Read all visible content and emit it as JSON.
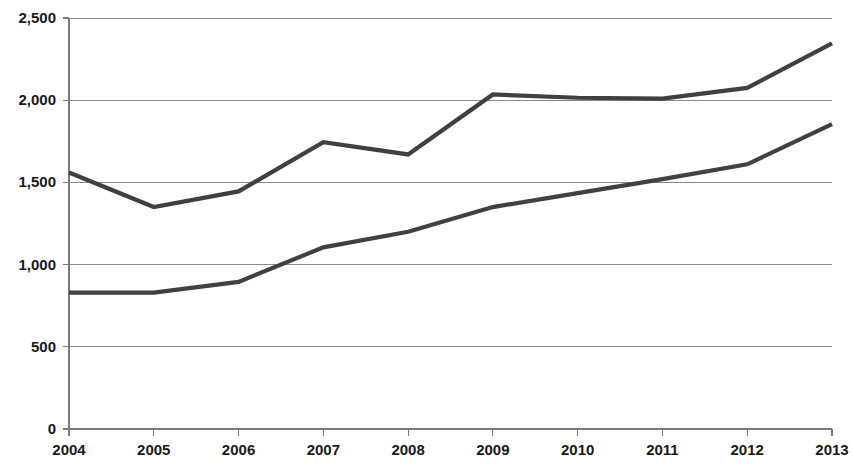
{
  "chart_data": {
    "type": "line",
    "title": "",
    "subtitle": "",
    "xlabel": "",
    "ylabel": "",
    "categories": [
      "2004",
      "2005",
      "2006",
      "2007",
      "2008",
      "2009",
      "2010",
      "2011",
      "2012",
      "2013"
    ],
    "x": [
      2004,
      2005,
      2006,
      2007,
      2008,
      2009,
      2010,
      2011,
      2012,
      2013
    ],
    "series": [
      {
        "name": "series-1",
        "values": [
          1560,
          1350,
          1445,
          1745,
          1670,
          2035,
          2015,
          2010,
          2075,
          2345
        ],
        "color": "#404040"
      },
      {
        "name": "series-2",
        "values": [
          830,
          830,
          895,
          1105,
          1200,
          1350,
          1435,
          1520,
          1610,
          1855
        ],
        "color": "#404040"
      }
    ],
    "ylim": [
      0,
      2500
    ],
    "y_ticks": [
      0,
      500,
      1000,
      1500,
      2000,
      2500
    ],
    "y_tick_labels": [
      "0",
      "500",
      "1,000",
      "1,500",
      "2,000",
      "2,500"
    ],
    "x_tick_labels": [
      "2004",
      "2005",
      "2006",
      "2007",
      "2008",
      "2009",
      "2010",
      "2011",
      "2012",
      "2013"
    ],
    "grid": true,
    "grid_color": "#8a8a8a",
    "legend": false,
    "legend_position": "none",
    "annotations": [],
    "background_color": "#ffffff",
    "axis_color": "#7a7a7a",
    "text_color": "#1a1a1a"
  },
  "plot_geometry": {
    "left": 69,
    "right": 832,
    "top": 18,
    "bottom": 429
  }
}
